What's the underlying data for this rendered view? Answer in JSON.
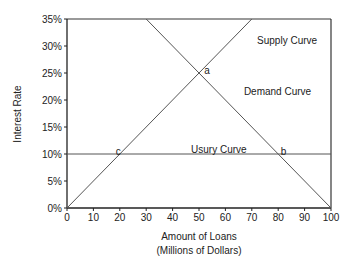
{
  "chart_data": {
    "type": "line",
    "title": "",
    "xlabel": "Amount of Loans",
    "xlabel_line2": "(Millions of Dollars)",
    "ylabel": "Interest Rate",
    "xlim": [
      0,
      100
    ],
    "ylim": [
      0,
      35
    ],
    "x_ticks": [
      "0",
      "10",
      "20",
      "30",
      "40",
      "50",
      "60",
      "70",
      "80",
      "90",
      "100"
    ],
    "y_ticks": [
      "0%",
      "5%",
      "10%",
      "15%",
      "20%",
      "25%",
      "30%",
      "35%"
    ],
    "grid": false,
    "legend": "none",
    "series": [
      {
        "name": "Supply Curve",
        "points": [
          [
            0,
            0
          ],
          [
            70,
            35
          ]
        ]
      },
      {
        "name": "Demand Curve",
        "points": [
          [
            30,
            35
          ],
          [
            100,
            0
          ]
        ]
      },
      {
        "name": "Usury Curve",
        "points": [
          [
            0,
            10
          ],
          [
            100,
            10
          ]
        ]
      }
    ],
    "annotations": [
      {
        "text": "Supply Curve",
        "x": 72,
        "y": 31
      },
      {
        "text": "Demand Curve",
        "x": 67,
        "y": 21.5
      },
      {
        "text": "Usury Curve",
        "x": 47,
        "y": 10.8
      },
      {
        "text": "a",
        "x": 52,
        "y": 25.5
      },
      {
        "text": "b",
        "x": 81,
        "y": 10.5
      },
      {
        "text": "c",
        "x": 18.5,
        "y": 10.5
      }
    ],
    "intersections": [
      {
        "label": "a",
        "x": 50,
        "y": 25
      },
      {
        "label": "b",
        "x": 80,
        "y": 10
      },
      {
        "label": "c",
        "x": 20,
        "y": 10
      }
    ]
  },
  "colors": {
    "axis": "#222222",
    "lines": "#555555"
  }
}
